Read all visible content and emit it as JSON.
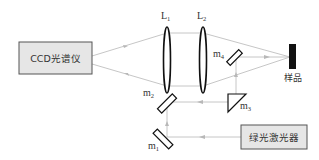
{
  "diagram": {
    "title": "",
    "components": {
      "ccd_spectrometer": {
        "label": "CCD光谱仪"
      },
      "green_laser": {
        "label": "绿光激光器"
      },
      "sample": {
        "label": "样品"
      },
      "lens_1": {
        "label": "L",
        "subscript": "1"
      },
      "lens_2": {
        "label": "L",
        "subscript": "2"
      },
      "mirror_1": {
        "label": "m",
        "subscript": "1"
      },
      "mirror_2": {
        "label": "m",
        "subscript": "2"
      },
      "mirror_3": {
        "label": "m",
        "subscript": "3"
      },
      "mirror_4": {
        "label": "m",
        "subscript": "4"
      }
    },
    "colors": {
      "box_fill": "#e6e6e6",
      "box_stroke": "#555555",
      "ray": "#b8b8b8",
      "sample": "#111111",
      "optics": "#111111"
    }
  }
}
